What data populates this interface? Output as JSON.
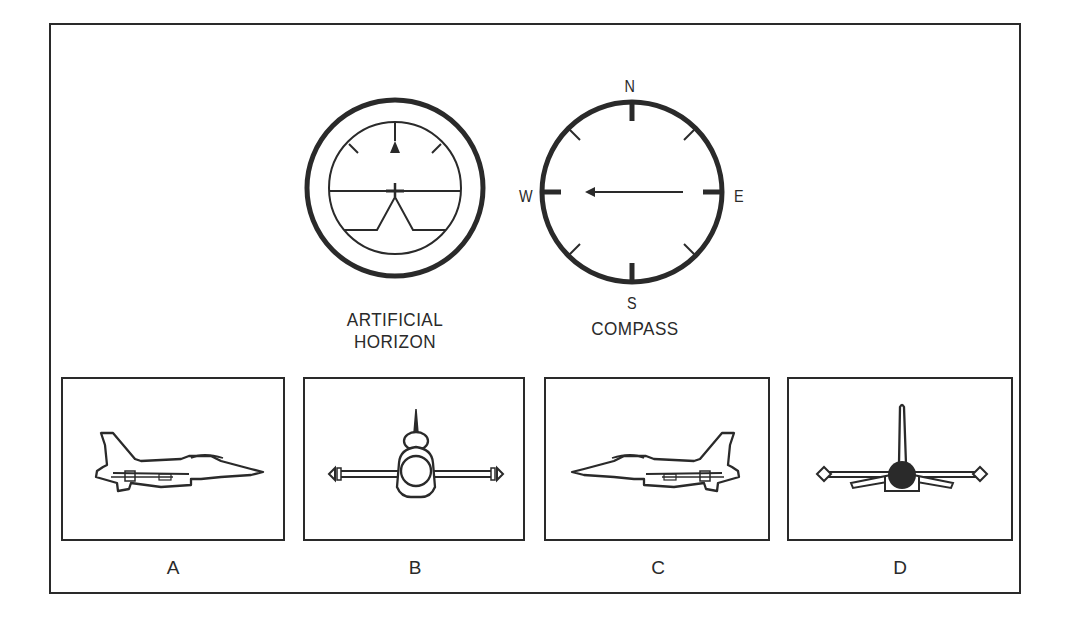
{
  "instruments": {
    "artificial_horizon": {
      "label_line1": "ARTIFICIAL",
      "label_line2": "HORIZON",
      "state": "level wings, nose slightly down? horizon at center"
    },
    "compass": {
      "label": "COMPASS",
      "north": "N",
      "south": "S",
      "east": "E",
      "west": "W",
      "heading": "West"
    }
  },
  "options": [
    {
      "letter": "A",
      "view": "side view, aircraft facing right"
    },
    {
      "letter": "B",
      "view": "front view, level"
    },
    {
      "letter": "C",
      "view": "side view, aircraft facing left"
    },
    {
      "letter": "D",
      "view": "rear view, level"
    }
  ],
  "colors": {
    "ink": "#2a2a2a",
    "background": "#ffffff"
  }
}
